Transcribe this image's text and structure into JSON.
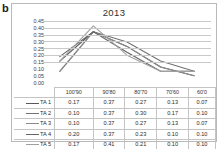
{
  "panel": {
    "label": "b"
  },
  "chart": {
    "title": "2013"
  },
  "chart_data": {
    "type": "line",
    "title": "2013",
    "xlabel": "",
    "ylabel": "",
    "categories": [
      "100'90",
      "90'80",
      "80'70",
      "70'60",
      "60'0"
    ],
    "series": [
      {
        "name": "TA 1",
        "values": [
          0.17,
          0.37,
          0.27,
          0.13,
          0.07
        ],
        "color": "#595959"
      },
      {
        "name": "TA 2",
        "values": [
          0.1,
          0.37,
          0.3,
          0.17,
          0.1
        ],
        "color": "#737373"
      },
      {
        "name": "TA 3",
        "values": [
          0.1,
          0.37,
          0.27,
          0.13,
          0.07
        ],
        "color": "#8c8c8c"
      },
      {
        "name": "TA 4",
        "values": [
          0.2,
          0.37,
          0.23,
          0.1,
          0.1
        ],
        "color": "#666666"
      },
      {
        "name": "TA 5",
        "values": [
          0.17,
          0.41,
          0.21,
          0.1,
          0.1
        ],
        "color": "#a0a0a0"
      }
    ],
    "yticks": [
      "0.45",
      "0.40",
      "0.35",
      "0.30",
      "0.25",
      "0.20",
      "0.15",
      "0.10",
      "0.05",
      "0.00"
    ],
    "ylim": [
      0.0,
      0.45
    ],
    "grid": true,
    "legend_position": "table-left",
    "table": {
      "corner_label": "",
      "columns": [
        "100'90",
        "90'80",
        "80'70",
        "70'60",
        "60'0"
      ],
      "rows": [
        {
          "label": "TA 1",
          "cells": [
            "0.17",
            "0.37",
            "0.27",
            "0.13",
            "0.07"
          ]
        },
        {
          "label": "TA 2",
          "cells": [
            "0.10",
            "0.37",
            "0.30",
            "0.17",
            "0.10"
          ]
        },
        {
          "label": "TA 3",
          "cells": [
            "0.10",
            "0.37",
            "0.27",
            "0.13",
            "0.07"
          ]
        },
        {
          "label": "TA 4",
          "cells": [
            "0.20",
            "0.37",
            "0.23",
            "0.10",
            "0.10"
          ]
        },
        {
          "label": "TA 5",
          "cells": [
            "0.17",
            "0.41",
            "0.21",
            "0.10",
            "0.10"
          ]
        }
      ]
    }
  }
}
